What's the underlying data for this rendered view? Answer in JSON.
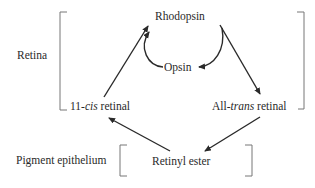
{
  "regions": {
    "retina": "Retina",
    "pigment_epithelium": "Pigment epithelium"
  },
  "nodes": {
    "rhodopsin": "Rhodopsin",
    "opsin": "Opsin",
    "cis_prefix": "11-",
    "cis_italic": "cis",
    "cis_suffix": " retinal",
    "trans_prefix": "All-",
    "trans_italic": "trans",
    "trans_suffix": " retinal",
    "retinyl_ester": "Retinyl ester"
  },
  "edges": [
    {
      "from": "11-cis retinal",
      "to": "Rhodopsin"
    },
    {
      "from": "Rhodopsin",
      "to": "Opsin"
    },
    {
      "from": "Opsin",
      "to": "Rhodopsin"
    },
    {
      "from": "Rhodopsin",
      "to": "All-trans retinal"
    },
    {
      "from": "All-trans retinal",
      "to": "Retinyl ester"
    },
    {
      "from": "Retinyl ester",
      "to": "11-cis retinal"
    }
  ],
  "colors": {
    "ink": "#2a2a2a",
    "bracket": "#555555"
  }
}
